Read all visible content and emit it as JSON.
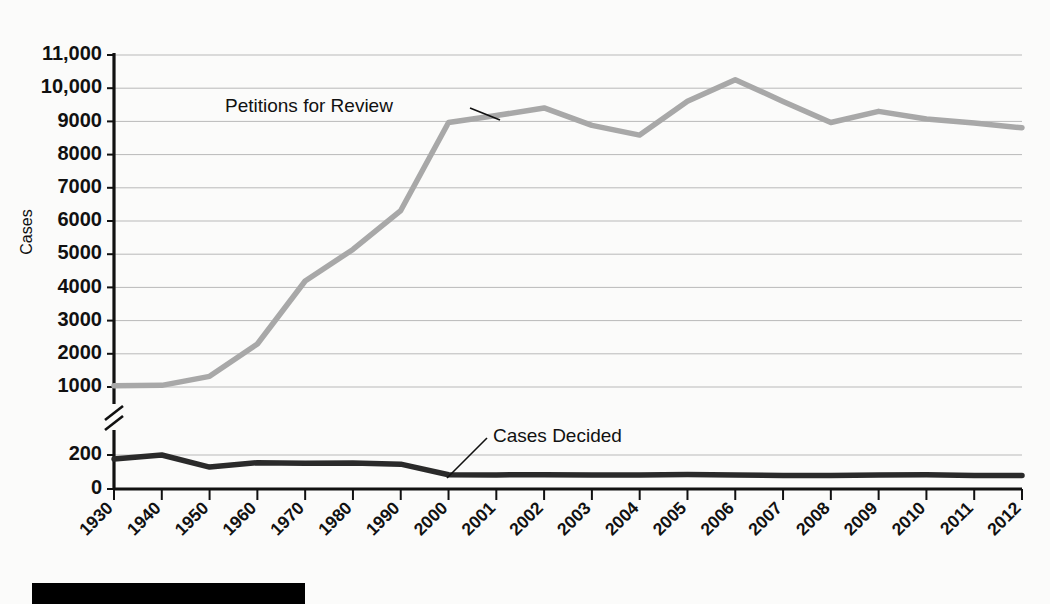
{
  "chart_data": {
    "type": "line",
    "title": "",
    "xlabel": "",
    "ylabel": "Cases",
    "grid": true,
    "legend_position": "inline-annotation",
    "axis_break": {
      "present": true,
      "between": [
        200,
        1000
      ]
    },
    "categories": [
      "1930",
      "1940",
      "1950",
      "1960",
      "1970",
      "1980",
      "1990",
      "2000",
      "2001",
      "2002",
      "2003",
      "2004",
      "2005",
      "2006",
      "2007",
      "2008",
      "2009",
      "2010",
      "2011",
      "2012"
    ],
    "y_ticks_upper": [
      "11,000",
      "10,000",
      "9000",
      "8000",
      "7000",
      "6000",
      "5000",
      "4000",
      "3000",
      "2000",
      "1000"
    ],
    "y_ticks_lower": [
      "200",
      "0"
    ],
    "ylim_upper": [
      1000,
      11000
    ],
    "ylim_lower": [
      0,
      200
    ],
    "series": [
      {
        "name": "Petitions for Review",
        "color": "#a8a8a8",
        "values": [
          1039,
          1049,
          1321,
          2296,
          4192,
          5144,
          6316,
          8965,
          9176,
          9406,
          8882,
          8588,
          9608,
          10256,
          9602,
          8966,
          9302,
          9072,
          8952,
          8806
        ]
      },
      {
        "name": "Cases Decided",
        "color": "#2a2a2a",
        "values": [
          176,
          200,
          129,
          155,
          152,
          153,
          146,
          84,
          83,
          84,
          83,
          82,
          85,
          83,
          80,
          80,
          83,
          84,
          80,
          80
        ]
      }
    ],
    "annotations": [
      {
        "label": "Petitions for Review",
        "target_series": "Petitions for Review",
        "target_x": "2000"
      },
      {
        "label": "Cases Decided",
        "target_series": "Cases Decided",
        "target_x": "2000"
      }
    ]
  },
  "axis": {
    "y_title": "Cases"
  },
  "decor": {
    "bottom_bar": ""
  }
}
